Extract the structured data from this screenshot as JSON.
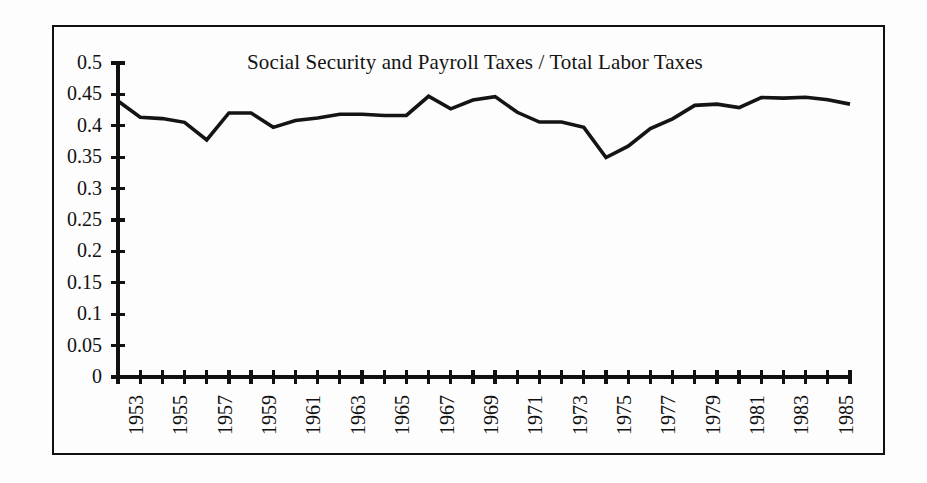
{
  "chart_data": {
    "type": "line",
    "title": "Social Security and Payroll Taxes / Total Labor Taxes",
    "xlabel": "",
    "ylabel": "",
    "grid": false,
    "legend": "none",
    "xlim": [
      1953,
      1986
    ],
    "ylim": [
      0,
      0.5
    ],
    "y_ticks": [
      0,
      0.05,
      0.1,
      0.15,
      0.2,
      0.25,
      0.3,
      0.35,
      0.4,
      0.45,
      0.5
    ],
    "y_tick_labels": [
      "0",
      "0.05",
      "0.1",
      "0.15",
      "0.2",
      "0.25",
      "0.3",
      "0.35",
      "0.4",
      "0.45",
      "0.5"
    ],
    "x_tick_values": [
      1953,
      1954,
      1955,
      1956,
      1957,
      1958,
      1959,
      1960,
      1961,
      1962,
      1963,
      1964,
      1965,
      1966,
      1967,
      1968,
      1969,
      1970,
      1971,
      1972,
      1973,
      1974,
      1975,
      1976,
      1977,
      1978,
      1979,
      1980,
      1981,
      1982,
      1983,
      1984,
      1985,
      1986
    ],
    "x_tick_labels": [
      "1953",
      "",
      "1955",
      "",
      "1957",
      "",
      "1959",
      "",
      "1961",
      "",
      "1963",
      "",
      "1965",
      "",
      "1967",
      "",
      "1969",
      "",
      "1971",
      "",
      "1973",
      "",
      "1975",
      "",
      "1977",
      "",
      "1979",
      "",
      "1981",
      "",
      "1983",
      "",
      "1985",
      ""
    ],
    "series": [
      {
        "name": "Social Security and Payroll Taxes / Total Labor Taxes",
        "color": "#141414",
        "x": [
          1953,
          1954,
          1955,
          1956,
          1957,
          1958,
          1959,
          1960,
          1961,
          1962,
          1963,
          1964,
          1965,
          1966,
          1967,
          1968,
          1969,
          1970,
          1971,
          1972,
          1973,
          1974,
          1975,
          1976,
          1977,
          1978,
          1979,
          1980,
          1981,
          1982,
          1983,
          1984,
          1985,
          1986
        ],
        "values": [
          0.4395,
          0.4135,
          0.4115,
          0.4055,
          0.3775,
          0.4205,
          0.4205,
          0.3975,
          0.4085,
          0.4125,
          0.4185,
          0.4185,
          0.4165,
          0.4165,
          0.447,
          0.427,
          0.441,
          0.4465,
          0.4215,
          0.406,
          0.406,
          0.3975,
          0.3495,
          0.3675,
          0.3955,
          0.411,
          0.4325,
          0.4345,
          0.429,
          0.445,
          0.444,
          0.4455,
          0.4415,
          0.4345
        ]
      }
    ]
  },
  "figure": {
    "background_color": "#fdfdfd",
    "border_color": "#111111",
    "axis_color": "#111111"
  }
}
